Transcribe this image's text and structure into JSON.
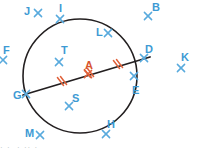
{
  "figure": {
    "type": "circle-geometry-diagram",
    "width": 199,
    "height": 151,
    "background_color": "#ffffff"
  },
  "colors": {
    "point_blue": "#3d9ad4",
    "marker_blue": "#58aadd",
    "tick_red": "#e0613a",
    "label_red": "#d8552e",
    "circle_stroke": "#231f20",
    "chord_stroke": "#231f20",
    "footer_gray": "#b9bfc4"
  },
  "circle": {
    "center_x": 80,
    "center_y": 76,
    "radius": 57,
    "stroke_width": 1.6
  },
  "chord": {
    "name": "GD",
    "from": "G",
    "to": "D",
    "x1": 23,
    "y1": 95,
    "x2": 150,
    "y2": 57,
    "stroke_width": 1.8,
    "midpoint_label": "A"
  },
  "tick_marks": [
    {
      "name": "tick-left-double",
      "x": 62,
      "y": 81,
      "count": 2
    },
    {
      "name": "tick-center-double",
      "x": 89,
      "y": 73,
      "count": 2
    },
    {
      "name": "tick-right-double",
      "x": 118,
      "y": 64,
      "count": 2
    }
  ],
  "points": [
    {
      "id": "J",
      "label": "J",
      "label_x": 24,
      "label_y": 6,
      "marker_x": 38,
      "marker_y": 13,
      "color": "blue",
      "on_circle": false
    },
    {
      "id": "I",
      "label": "I",
      "label_x": 59,
      "label_y": 3,
      "marker_x": 60,
      "marker_y": 19,
      "color": "blue",
      "on_circle": true
    },
    {
      "id": "B",
      "label": "B",
      "label_x": 152,
      "label_y": 2,
      "marker_x": 148,
      "marker_y": 16,
      "color": "blue",
      "on_circle": false
    },
    {
      "id": "L",
      "label": "L",
      "label_x": 96,
      "label_y": 27,
      "marker_x": 108,
      "marker_y": 33,
      "color": "blue",
      "on_circle": false
    },
    {
      "id": "F",
      "label": "F",
      "label_x": 3,
      "label_y": 45,
      "marker_x": 3,
      "marker_y": 60,
      "color": "blue",
      "on_circle": false
    },
    {
      "id": "T",
      "label": "T",
      "label_x": 61,
      "label_y": 45,
      "marker_x": 59,
      "marker_y": 62,
      "color": "blue",
      "on_circle": false
    },
    {
      "id": "D",
      "label": "D",
      "label_x": 145,
      "label_y": 44,
      "marker_x": 144,
      "marker_y": 58,
      "color": "blue",
      "on_circle": true
    },
    {
      "id": "K",
      "label": "K",
      "label_x": 181,
      "label_y": 52,
      "marker_x": 181,
      "marker_y": 68,
      "color": "blue",
      "on_circle": false
    },
    {
      "id": "A",
      "label": "A",
      "label_x": 85,
      "label_y": 60,
      "marker_x": 88,
      "marker_y": 74,
      "color": "red",
      "on_circle": false
    },
    {
      "id": "G",
      "label": "G",
      "label_x": 13,
      "label_y": 90,
      "marker_x": 26,
      "marker_y": 94,
      "color": "blue",
      "on_circle": true
    },
    {
      "id": "E",
      "label": "E",
      "label_x": 132,
      "label_y": 85,
      "marker_x": 134,
      "marker_y": 76,
      "color": "blue",
      "on_circle": false
    },
    {
      "id": "S",
      "label": "S",
      "label_x": 72,
      "label_y": 93,
      "marker_x": 69,
      "marker_y": 106,
      "color": "blue",
      "on_circle": false
    },
    {
      "id": "M",
      "label": "M",
      "label_x": 25,
      "label_y": 128,
      "marker_x": 40,
      "marker_y": 135,
      "color": "blue",
      "on_circle": false
    },
    {
      "id": "H",
      "label": "H",
      "label_x": 107,
      "label_y": 119,
      "marker_x": 106,
      "marker_y": 134,
      "color": "blue",
      "on_circle": true
    }
  ],
  "footer": {
    "clipped_text": "· ·  · ·· ·"
  }
}
